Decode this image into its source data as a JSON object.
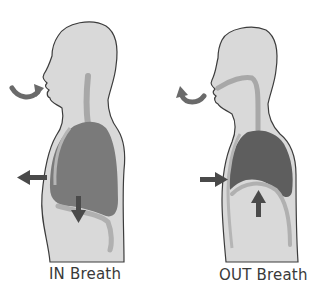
{
  "figures": [
    {
      "id": "in-breath",
      "label": "IN Breath",
      "arrows": [
        "air-in-curved-arrow",
        "chest-expand-left-arrow",
        "diaphragm-down-arrow"
      ]
    },
    {
      "id": "out-breath",
      "label": "OUT Breath",
      "arrows": [
        "air-out-curved-arrow",
        "chest-contract-right-arrow",
        "diaphragm-up-arrow"
      ]
    }
  ],
  "colors": {
    "body_fill": "#d9d9d9",
    "outline": "#3c3c3c",
    "airway": "#a8a8a8",
    "lung_in": "#7a7a7a",
    "lung_out": "#5e5e5e",
    "arrow": "#4a4a4a",
    "background": "#ffffff"
  }
}
